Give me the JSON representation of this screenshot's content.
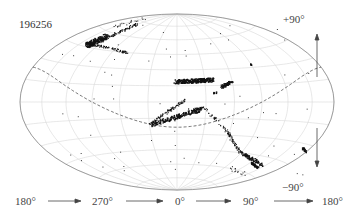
{
  "chart_data": {
    "type": "scatter",
    "projection": "hammer-aitoff (all-sky)",
    "title": "196256",
    "xlabel": "longitude",
    "ylabel": "latitude",
    "x_tick_labels": [
      "180°",
      "270°",
      "0°",
      "90°",
      "180°"
    ],
    "y_tick_labels": [
      "+90°",
      "−90°"
    ],
    "xlim": [
      180,
      -180
    ],
    "ylim": [
      -90,
      90
    ],
    "grid": {
      "meridian_step_deg": 30,
      "parallel_step_deg": 15,
      "color": "#d9d9d9"
    },
    "reference_curve": {
      "name": "dashed great circle (ecliptic)",
      "style": "dashed",
      "color": "#555555"
    },
    "series": [
      {
        "name": "stream A (upper-left clump)",
        "approx_lon_lat": [
          [
            -120,
            50
          ],
          [
            -105,
            52
          ],
          [
            -90,
            55
          ],
          [
            -70,
            60
          ],
          [
            -100,
            45
          ],
          [
            -80,
            42
          ]
        ]
      },
      {
        "name": "stream B (central diagonal)",
        "approx_lon_lat": [
          [
            0,
            5
          ],
          [
            10,
            10
          ],
          [
            20,
            15
          ],
          [
            30,
            18
          ],
          [
            40,
            20
          ]
        ]
      },
      {
        "name": "stream C (central lower)",
        "approx_lon_lat": [
          [
            -5,
            0
          ],
          [
            5,
            2
          ],
          [
            15,
            5
          ],
          [
            25,
            8
          ]
        ]
      },
      {
        "name": "stream D (right, long arc)",
        "approx_lon_lat": [
          [
            25,
            15
          ],
          [
            35,
            10
          ],
          [
            45,
            0
          ],
          [
            55,
            -20
          ],
          [
            65,
            -40
          ],
          [
            75,
            -50
          ]
        ]
      },
      {
        "name": "isolated clump",
        "approx_lon_lat": [
          [
            150,
            -45
          ]
        ]
      },
      {
        "name": "isolated point",
        "approx_lon_lat": [
          [
            55,
            25
          ]
        ]
      }
    ],
    "marker_color": "#111111"
  },
  "labels": {
    "id": "196256",
    "north": "+90°",
    "south": "−90°",
    "lon": [
      "180°",
      "270°",
      "0°",
      "90°",
      "180°"
    ]
  }
}
